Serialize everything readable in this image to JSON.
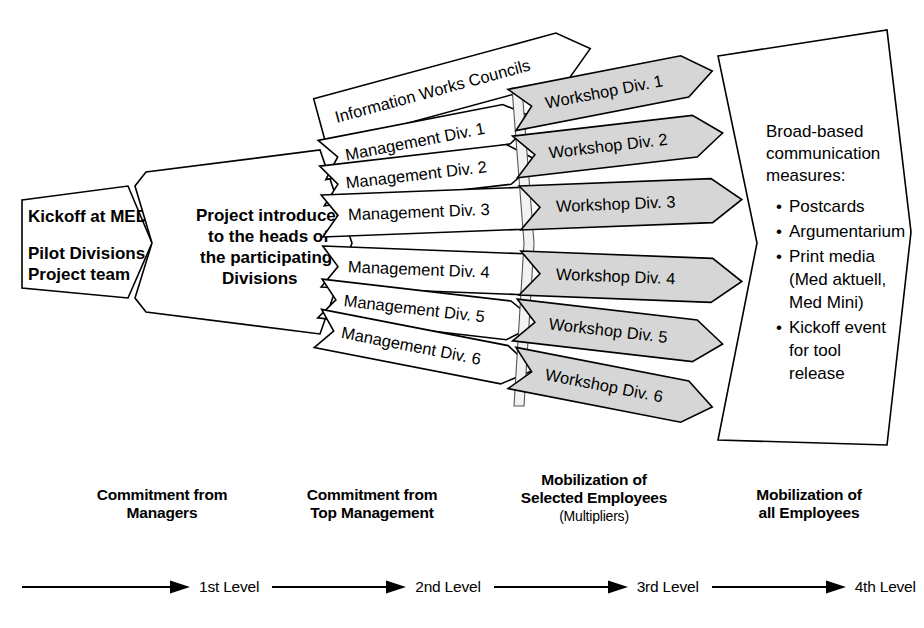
{
  "diagram": {
    "colors": {
      "outline": "#000000",
      "white_fill": "#ffffff",
      "gray_fill": "#d6d6d6",
      "background": "#ffffff"
    },
    "stage1": {
      "line1": "Kickoff at MED",
      "line2": "Pilot Divisions and",
      "line3": "Project team"
    },
    "stage2": {
      "line1": "Project introduced",
      "line2": "to the heads of",
      "line3": "the participating",
      "line4": "Divisions"
    },
    "works_council": {
      "label": "Information Works Councils"
    },
    "management_rows": [
      {
        "label": "Management Div. 1"
      },
      {
        "label": "Management Div. 2"
      },
      {
        "label": "Management Div. 3"
      },
      {
        "label": "Management Div. 4"
      },
      {
        "label": "Management Div. 5"
      },
      {
        "label": "Management Div. 6"
      }
    ],
    "workshop_rows": [
      {
        "label": "Workshop Div. 1"
      },
      {
        "label": "Workshop Div. 2"
      },
      {
        "label": "Workshop Div. 3"
      },
      {
        "label": "Workshop Div. 4"
      },
      {
        "label": "Workshop Div. 5"
      },
      {
        "label": "Workshop Div. 6"
      }
    ],
    "broad_panel": {
      "heading_line1": "Broad-based",
      "heading_line2": "communication",
      "heading_line3": "measures:",
      "bullets": [
        {
          "marker": "•",
          "line1": "Postcards"
        },
        {
          "marker": "•",
          "line1": "Argumentarium"
        },
        {
          "marker": "•",
          "line1": "Print media",
          "line2": "(Med aktuell,",
          "line3": "Med Mini)"
        },
        {
          "marker": "•",
          "line1": "Kickoff event",
          "line2": "for tool",
          "line3": "release"
        }
      ]
    },
    "stage_captions": [
      {
        "line1": "Commitment from",
        "line2": "Managers",
        "line3": ""
      },
      {
        "line1": "Commitment from",
        "line2": "Top Management",
        "line3": ""
      },
      {
        "line1": "Mobilization of",
        "line2": "Selected Employees",
        "line3": "(Multipliers)"
      },
      {
        "line1": "Mobilization of",
        "line2": "all Employees",
        "line3": ""
      }
    ],
    "levels": [
      {
        "label": "1st Level"
      },
      {
        "label": "2nd Level"
      },
      {
        "label": "3rd Level"
      },
      {
        "label": "4th Level"
      }
    ]
  }
}
